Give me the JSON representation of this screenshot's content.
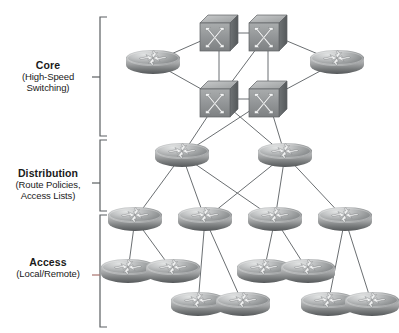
{
  "diagram": {
    "type": "network-topology",
    "background": "#ffffff",
    "line_color": "#6b6f72",
    "tiers": [
      {
        "id": "core",
        "title": "Core",
        "subtitle_lines": [
          "(High-Speed",
          "Switching)"
        ],
        "bracket": {
          "top": 17,
          "bottom": 136,
          "x": 100,
          "tick_y": 77
        },
        "label_y": 60
      },
      {
        "id": "distribution",
        "title": "Distribution",
        "subtitle_lines": [
          "(Route Policies,",
          "Access Lists)"
        ],
        "bracket": {
          "top": 140,
          "bottom": 211,
          "x": 100,
          "tick_y": 183
        },
        "label_y": 168
      },
      {
        "id": "access",
        "title": "Access",
        "subtitle_lines": [
          "(Local/Remote)"
        ],
        "bracket": {
          "top": 215,
          "bottom": 327,
          "x": 100,
          "tick_y": 275
        },
        "label_y": 257
      }
    ],
    "nodes": [
      {
        "id": "core-sw-tl",
        "kind": "switch",
        "label": "core-switch-top-left",
        "x": 199,
        "y": 14
      },
      {
        "id": "core-sw-tr",
        "kind": "switch",
        "label": "core-switch-top-right",
        "x": 248,
        "y": 14
      },
      {
        "id": "core-sw-bl",
        "kind": "switch",
        "label": "core-switch-bottom-left",
        "x": 199,
        "y": 80
      },
      {
        "id": "core-sw-br",
        "kind": "switch",
        "label": "core-switch-bottom-right",
        "x": 248,
        "y": 80
      },
      {
        "id": "core-rt-l",
        "kind": "router",
        "label": "core-router-left",
        "x": 126,
        "y": 50
      },
      {
        "id": "core-rt-r",
        "kind": "router",
        "label": "core-router-right",
        "x": 310,
        "y": 50
      },
      {
        "id": "dist-l",
        "kind": "router",
        "label": "distribution-router-left",
        "x": 155,
        "y": 143
      },
      {
        "id": "dist-r",
        "kind": "router",
        "label": "distribution-router-right",
        "x": 258,
        "y": 143
      },
      {
        "id": "acc-1",
        "kind": "router",
        "label": "access-router-1",
        "x": 108,
        "y": 207
      },
      {
        "id": "acc-2",
        "kind": "router",
        "label": "access-router-2",
        "x": 178,
        "y": 207
      },
      {
        "id": "acc-3",
        "kind": "router",
        "label": "access-router-3",
        "x": 248,
        "y": 207
      },
      {
        "id": "acc-4",
        "kind": "router",
        "label": "access-router-4",
        "x": 318,
        "y": 207
      },
      {
        "id": "leaf-1",
        "kind": "router",
        "label": "access-leaf-1",
        "x": 101,
        "y": 259
      },
      {
        "id": "leaf-2",
        "kind": "router",
        "label": "access-leaf-2",
        "x": 146,
        "y": 259
      },
      {
        "id": "leaf-3",
        "kind": "router",
        "label": "access-leaf-3",
        "x": 171,
        "y": 292
      },
      {
        "id": "leaf-4",
        "kind": "router",
        "label": "access-leaf-4",
        "x": 216,
        "y": 292
      },
      {
        "id": "leaf-5",
        "kind": "router",
        "label": "access-leaf-5",
        "x": 237,
        "y": 259
      },
      {
        "id": "leaf-6",
        "kind": "router",
        "label": "access-leaf-6",
        "x": 281,
        "y": 259
      },
      {
        "id": "leaf-7",
        "kind": "router",
        "label": "access-leaf-7",
        "x": 301,
        "y": 292
      },
      {
        "id": "leaf-8",
        "kind": "router",
        "label": "access-leaf-8",
        "x": 345,
        "y": 292
      }
    ],
    "links": [
      {
        "from": "core-sw-tl",
        "to": "core-sw-tr"
      },
      {
        "from": "core-sw-bl",
        "to": "core-sw-br"
      },
      {
        "from": "core-sw-tl",
        "to": "core-sw-bl"
      },
      {
        "from": "core-sw-tr",
        "to": "core-sw-br"
      },
      {
        "from": "core-sw-tr",
        "to": "core-sw-bl"
      },
      {
        "from": "core-rt-l",
        "to": "core-sw-tl"
      },
      {
        "from": "core-rt-l",
        "to": "core-sw-bl"
      },
      {
        "from": "core-rt-r",
        "to": "core-sw-tr"
      },
      {
        "from": "core-rt-r",
        "to": "core-sw-br"
      },
      {
        "from": "core-sw-bl",
        "to": "dist-l"
      },
      {
        "from": "core-sw-bl",
        "to": "dist-r"
      },
      {
        "from": "core-sw-br",
        "to": "dist-l"
      },
      {
        "from": "core-sw-br",
        "to": "dist-r"
      },
      {
        "from": "dist-l",
        "to": "acc-1"
      },
      {
        "from": "dist-l",
        "to": "acc-2"
      },
      {
        "from": "dist-l",
        "to": "acc-3"
      },
      {
        "from": "dist-r",
        "to": "acc-2"
      },
      {
        "from": "dist-r",
        "to": "acc-3"
      },
      {
        "from": "dist-r",
        "to": "acc-4"
      },
      {
        "from": "acc-1",
        "to": "leaf-1"
      },
      {
        "from": "acc-1",
        "to": "leaf-2"
      },
      {
        "from": "acc-2",
        "to": "leaf-3"
      },
      {
        "from": "acc-2",
        "to": "leaf-4"
      },
      {
        "from": "acc-3",
        "to": "leaf-5"
      },
      {
        "from": "acc-3",
        "to": "leaf-6"
      },
      {
        "from": "acc-4",
        "to": "leaf-7"
      },
      {
        "from": "acc-4",
        "to": "leaf-8"
      }
    ]
  }
}
